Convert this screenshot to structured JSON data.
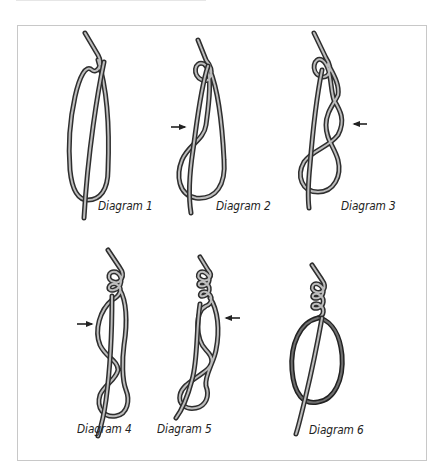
{
  "figure": {
    "colors": {
      "rope_outline": "#2e2e2e",
      "rope_fill": "#bdbdbd",
      "frame_border": "#c8c8c8",
      "background": "#ffffff",
      "label": "#222222"
    },
    "diagrams": [
      {
        "id": 1,
        "label": "Diagram 1",
        "arrow": null
      },
      {
        "id": 2,
        "label": "Diagram 2",
        "arrow": "right"
      },
      {
        "id": 3,
        "label": "Diagram 3",
        "arrow": "left"
      },
      {
        "id": 4,
        "label": "Diagram 4",
        "arrow": "right"
      },
      {
        "id": 5,
        "label": "Diagram 5",
        "arrow": "left"
      },
      {
        "id": 6,
        "label": "Diagram 6",
        "arrow": null
      }
    ],
    "icons": {
      "arrow_right": "arrow-right-icon",
      "arrow_left": "arrow-left-icon"
    }
  }
}
